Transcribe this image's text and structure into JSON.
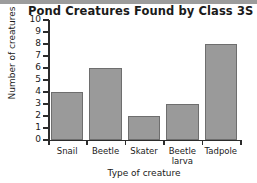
{
  "chart_data": {
    "type": "bar",
    "title": "Pond Creatures Found by Class 3S",
    "xlabel": "Type of creature",
    "ylabel": "Number of creatures",
    "categories": [
      "Snail",
      "Beetle",
      "Skater",
      "Beetle larva",
      "Tadpole"
    ],
    "values": [
      4,
      6,
      2,
      3,
      8
    ],
    "ylim": [
      0,
      10
    ],
    "ytick_labels": [
      "0",
      "1",
      "2",
      "3",
      "4",
      "5",
      "6",
      "7",
      "8",
      "9",
      "10"
    ],
    "grid": false,
    "legend": null,
    "bar_color": "#9a9a9a",
    "bar_edge_color": "#6e6e6e",
    "axis_color": "#2b2b2b",
    "background": "#ffffff"
  }
}
